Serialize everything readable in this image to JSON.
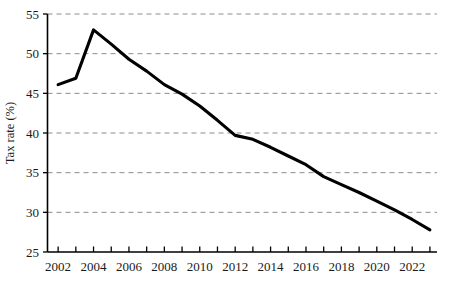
{
  "chart_data": {
    "type": "line",
    "title": "",
    "xlabel": "",
    "ylabel": "Tax rate (%)",
    "xlim": [
      2001.4,
      2023.4
    ],
    "ylim": [
      25,
      55
    ],
    "grid": true,
    "legend": null,
    "y_ticks": [
      25,
      30,
      35,
      40,
      45,
      50,
      55
    ],
    "y_tick_labels": [
      "25",
      "30",
      "35",
      "40",
      "45",
      "50",
      "55"
    ],
    "x_ticks": [
      2002,
      2003,
      2004,
      2005,
      2006,
      2007,
      2008,
      2009,
      2010,
      2011,
      2012,
      2013,
      2014,
      2015,
      2016,
      2017,
      2018,
      2019,
      2020,
      2021,
      2022,
      2023
    ],
    "x_tick_labels": [
      "2002",
      "",
      "2004",
      "",
      "2006",
      "",
      "2008",
      "",
      "2010",
      "",
      "2012",
      "",
      "2014",
      "",
      "2016",
      "",
      "2018",
      "",
      "2020",
      "",
      "2022",
      ""
    ],
    "x": [
      2002,
      2003,
      2004,
      2005,
      2006,
      2007,
      2008,
      2009,
      2010,
      2011,
      2012,
      2013,
      2014,
      2015,
      2016,
      2017,
      2018,
      2019,
      2020,
      2021,
      2022,
      2023
    ],
    "values": [
      46.1,
      46.9,
      53.0,
      51.2,
      49.3,
      47.8,
      46.1,
      44.9,
      43.4,
      41.6,
      39.7,
      39.2,
      38.2,
      37.1,
      36.0,
      34.5,
      33.5,
      32.5,
      31.4,
      30.3,
      29.1,
      27.8
    ],
    "series": [
      {
        "name": "Tax rate",
        "color": "#000000",
        "values": [
          46.1,
          46.9,
          53.0,
          51.2,
          49.3,
          47.8,
          46.1,
          44.9,
          43.4,
          41.6,
          39.7,
          39.2,
          38.2,
          37.1,
          36.0,
          34.5,
          33.5,
          32.5,
          31.4,
          30.3,
          29.1,
          27.8
        ]
      }
    ]
  },
  "colors": {
    "line": "#000000",
    "grid": "#8c8c8c",
    "axis": "#000000",
    "background": "#ffffff"
  }
}
